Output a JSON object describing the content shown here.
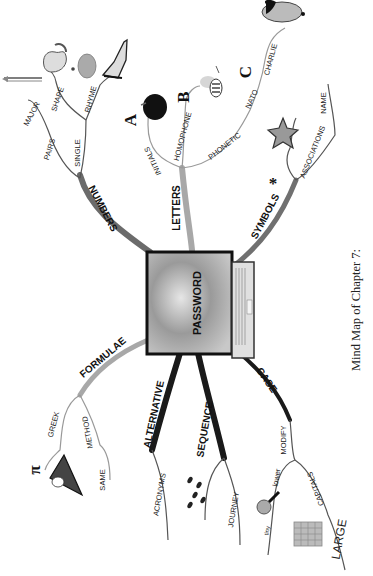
{
  "diagram": {
    "type": "mind-map",
    "orientation": "rotated-90-ccw",
    "center": {
      "label": "PASSWORD",
      "icon": "laptop-icon"
    },
    "caption": "Mind Map of Chapter 7:",
    "colors": {
      "branch_dark": "#1a1a1a",
      "branch_mid": "#555555",
      "branch_light": "#a8a8a8",
      "text": "#222222"
    },
    "branches": {
      "numbers": {
        "label": "NUMBERS",
        "children": {
          "pairs": {
            "label": "PAIRS",
            "children": {
              "major": {
                "label": "MAJOR"
              }
            }
          },
          "single": {
            "label": "SINGLE",
            "children": {
              "shape": {
                "label": "SHAPE",
                "icons": [
                  "pencil-icon",
                  "swan-icon"
                ]
              },
              "rhyme": {
                "label": "RHYME",
                "icons": [
                  "bun-icon",
                  "shoe-icon"
                ]
              }
            }
          }
        }
      },
      "letters": {
        "label": "LETTERS",
        "children": {
          "initials": {
            "label": "INITIALS",
            "glyph": "A",
            "icon": "apple-icon"
          },
          "homophone": {
            "label": "HOMOPHONE",
            "glyph": "B",
            "icon": "bee-icon"
          },
          "phonetic": {
            "label": "PHONETIC",
            "children": {
              "nato": {
                "label": "NATO",
                "glyph": "C"
              },
              "charlie": {
                "label": "CHARLIE",
                "icon": "charlie-chaplin-icon"
              }
            }
          }
        }
      },
      "symbols": {
        "label": "SYMBOLS",
        "glyph": "*",
        "children": {
          "associations": {
            "label": "ASSOCIATIONS",
            "icon": "starfish-icon"
          },
          "name": {
            "label": "NAME"
          }
        }
      },
      "formulae": {
        "label": "FORMULAE",
        "children": {
          "greek": {
            "label": "GREEK",
            "glyph": "π",
            "icon": "pie-icon"
          },
          "method": {
            "label": "METHOD"
          },
          "same": {
            "label": "SAME"
          }
        }
      },
      "alternative": {
        "label": "ALTERNATIVE",
        "children": {
          "acronyms": {
            "label": "ACRONYMS"
          }
        }
      },
      "sequence": {
        "label": "SEQUENCE",
        "children": {
          "journey": {
            "label": "JOURNEY",
            "icon": "footprints-icon"
          }
        }
      },
      "case": {
        "label": "CASE",
        "children": {
          "modify": {
            "label": "MODIFY",
            "children": {
              "lower": {
                "label": "lower",
                "sub": "tiny",
                "icon": "magnifier-icon"
              },
              "capitals": {
                "label": "CAPITALS",
                "sub": "LARGE",
                "icon": "building-icon"
              }
            }
          }
        }
      }
    }
  }
}
